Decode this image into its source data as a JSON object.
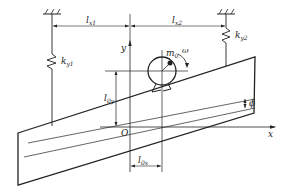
{
  "diagram": {
    "title": "",
    "type": "vibrating plate with eccentric rotor motor on two springs",
    "labels": {
      "l_x1": {
        "base": "l",
        "sub": "x1"
      },
      "l_x2": {
        "base": "l",
        "sub": "x2"
      },
      "k_y1": {
        "base": "k",
        "sub": "y1"
      },
      "k_y2": {
        "base": "k",
        "sub": "y2"
      },
      "m_0": {
        "base": "m",
        "sub": "0"
      },
      "omega": "ω",
      "l_0y": {
        "base": "l",
        "sub": "0y"
      },
      "l_0x": {
        "base": "l",
        "sub": "0x"
      },
      "phi": "ϕ",
      "origin": "O",
      "x_axis": "x",
      "y_axis": "y"
    },
    "components": [
      {
        "name": "left-ground-support",
        "description": "fixed ground hatch above left spring"
      },
      {
        "name": "right-ground-support",
        "description": "fixed ground hatch above right spring"
      },
      {
        "name": "left-spring",
        "label": "k_y1"
      },
      {
        "name": "right-spring",
        "label": "k_y2"
      },
      {
        "name": "inclined-plate",
        "description": "tilted rectangular plate (parallelogram)"
      },
      {
        "name": "motor",
        "description": "circular motor with eccentric mass m0 rotating at ω"
      },
      {
        "name": "coordinate-axes",
        "description": "x horizontal, y vertical, origin O"
      }
    ]
  }
}
